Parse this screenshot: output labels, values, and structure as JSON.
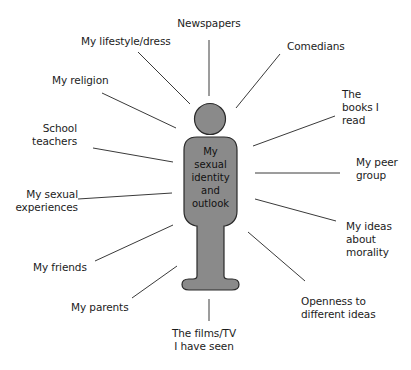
{
  "diagram": {
    "center": {
      "lines": [
        "My",
        "sexual",
        "identity",
        "and",
        "outlook"
      ]
    },
    "colors": {
      "figure_fill": "#8a8a8a",
      "figure_stroke": "#2a2a2a",
      "line": "#3a3a3a",
      "text": "#1c1c1c",
      "background": "#ffffff"
    },
    "influences": [
      {
        "id": "newspapers",
        "lines": [
          "Newspapers"
        ]
      },
      {
        "id": "lifestyle",
        "lines": [
          "My lifestyle/dress"
        ]
      },
      {
        "id": "comedians",
        "lines": [
          "Comedians"
        ]
      },
      {
        "id": "religion",
        "lines": [
          "My religion"
        ]
      },
      {
        "id": "books",
        "lines": [
          "The",
          "books I",
          "read"
        ]
      },
      {
        "id": "teachers",
        "lines": [
          "School",
          "teachers"
        ]
      },
      {
        "id": "peer-group",
        "lines": [
          "My peer",
          "group"
        ]
      },
      {
        "id": "sexual-experiences",
        "lines": [
          "My sexual",
          "experiences"
        ]
      },
      {
        "id": "morality",
        "lines": [
          "My ideas",
          "about",
          "morality"
        ]
      },
      {
        "id": "friends",
        "lines": [
          "My friends"
        ]
      },
      {
        "id": "openness",
        "lines": [
          "Openness to",
          "different ideas"
        ]
      },
      {
        "id": "parents",
        "lines": [
          "My parents"
        ]
      },
      {
        "id": "films-tv",
        "lines": [
          "The films/TV",
          "I have seen"
        ]
      }
    ]
  }
}
